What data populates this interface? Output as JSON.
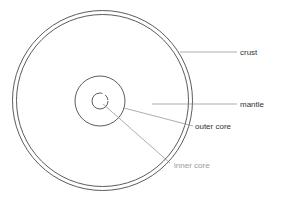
{
  "diagram": {
    "colors": {
      "stroke": "#4a4a4a",
      "leader": "#8a8a8a",
      "text": "#333333",
      "background": "#ffffff"
    },
    "layers": [
      {
        "id": "crust",
        "label": "crust"
      },
      {
        "id": "mantle",
        "label": "mantle"
      },
      {
        "id": "outer-core",
        "label": "outer core"
      },
      {
        "id": "inner-core",
        "label": "inner core"
      }
    ]
  }
}
